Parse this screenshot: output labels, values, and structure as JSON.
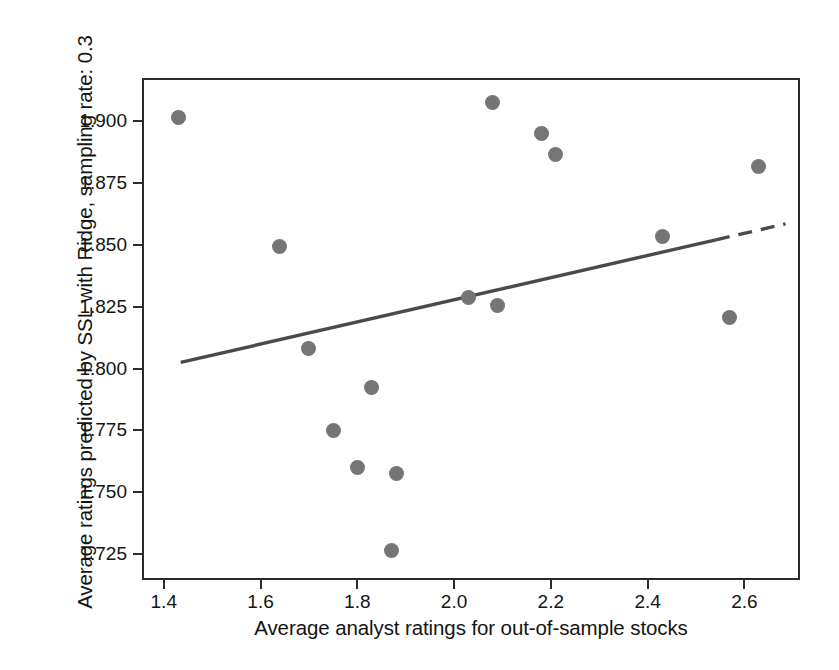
{
  "chart_data": {
    "type": "scatter",
    "title": "",
    "xlabel": "Average analyst ratings for out-of-sample stocks",
    "ylabel": "Average ratings predicted by SSL with Ridge, sampling rate: 0.3",
    "xlim": [
      1.355,
      2.715
    ],
    "ylim": [
      1.7145,
      1.9175
    ],
    "xticks": [
      1.4,
      1.6,
      1.8,
      2.0,
      2.2,
      2.4,
      2.6
    ],
    "xticklabels": [
      "1.4",
      "1.6",
      "1.8",
      "2.0",
      "2.2",
      "2.4",
      "2.6"
    ],
    "yticks": [
      1.725,
      1.75,
      1.775,
      1.8,
      1.825,
      1.85,
      1.875,
      1.9
    ],
    "yticklabels": [
      "1.725",
      "1.750",
      "1.775",
      "1.800",
      "1.825",
      "1.850",
      "1.875",
      "1.900"
    ],
    "grid": false,
    "legend": null,
    "marker_color": "#757575",
    "trendline_color": "#4a4a4a",
    "frame_color": "#2b2b2b",
    "points": [
      {
        "x": 1.43,
        "y": 1.9015
      },
      {
        "x": 1.64,
        "y": 1.8494
      },
      {
        "x": 1.7,
        "y": 1.808
      },
      {
        "x": 1.75,
        "y": 1.775
      },
      {
        "x": 1.8,
        "y": 1.76
      },
      {
        "x": 1.83,
        "y": 1.7925
      },
      {
        "x": 1.87,
        "y": 1.7265
      },
      {
        "x": 1.88,
        "y": 1.7575
      },
      {
        "x": 2.03,
        "y": 1.8288
      },
      {
        "x": 2.08,
        "y": 1.9077
      },
      {
        "x": 2.09,
        "y": 1.8255
      },
      {
        "x": 2.18,
        "y": 1.895
      },
      {
        "x": 2.21,
        "y": 1.8865
      },
      {
        "x": 2.43,
        "y": 1.8535
      },
      {
        "x": 2.57,
        "y": 1.8205
      },
      {
        "x": 2.63,
        "y": 1.8817
      }
    ],
    "trendline": {
      "x0": 1.435,
      "y0": 1.8025,
      "x1": 2.685,
      "y1": 1.8585,
      "style": "solid-to-dashed"
    }
  }
}
